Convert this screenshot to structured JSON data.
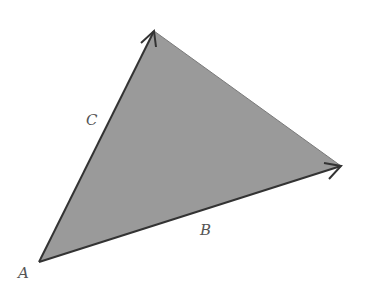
{
  "diagram": {
    "type": "vector-triangle",
    "colors": {
      "fill": "#9a9a9a",
      "edge": "#333333",
      "label": "#555555",
      "background": "#ffffff"
    },
    "vertices": {
      "A": {
        "x": 39,
        "y": 262
      },
      "top": {
        "x": 154,
        "y": 31
      },
      "right": {
        "x": 341,
        "y": 166
      }
    },
    "vectors": [
      {
        "name": "C",
        "from": "A",
        "to": "top",
        "arrow": true
      },
      {
        "name": "B",
        "from": "A",
        "to": "right",
        "arrow": true
      },
      {
        "name": "",
        "from": "top",
        "to": "right",
        "arrow": false
      }
    ],
    "labels": {
      "A": "A",
      "B": "B",
      "C": "C"
    }
  }
}
